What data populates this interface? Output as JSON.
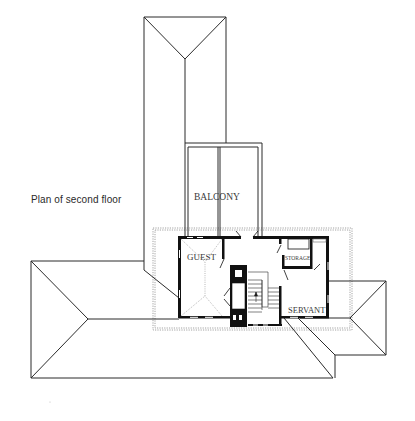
{
  "caption": "Plan of second floor",
  "rooms": {
    "balcony": "BALCONY",
    "guest": "GUEST",
    "storage": "STORAGE",
    "servant": "SERVANT"
  },
  "colors": {
    "line": "#2b2b2b",
    "wall": "#111111",
    "dotted": "#8a8a8a",
    "background": "#ffffff"
  }
}
